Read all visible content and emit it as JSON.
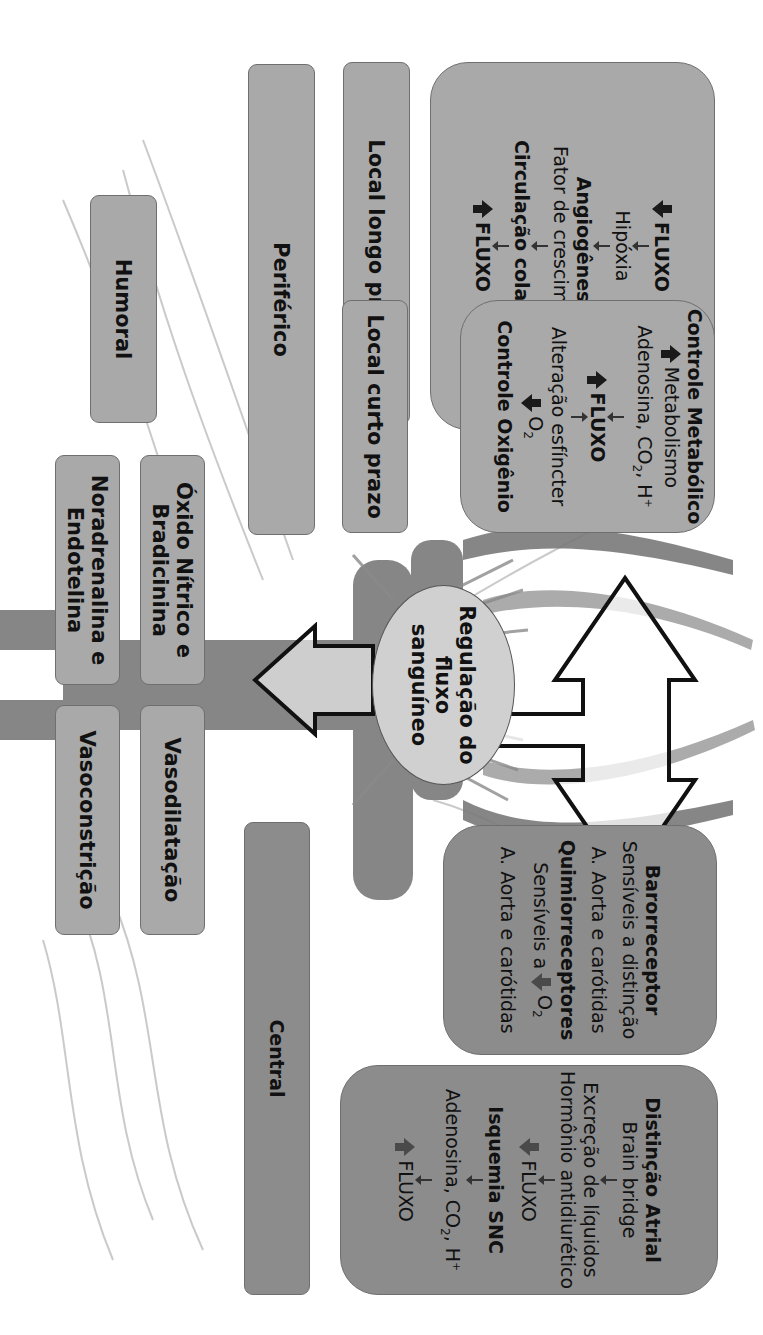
{
  "diagram": {
    "title": "Regulação do fluxo sanguíneo",
    "center_label": [
      "Regulação do",
      "fluxo",
      "sanguíneo"
    ],
    "categories": {
      "peripheral": "Periférico",
      "central": "Central",
      "humoral": "Humoral",
      "local_long": "Local longo prazo",
      "local_short": "Local curto prazo"
    },
    "boxes": {
      "angiogenesis": {
        "lines": [
          {
            "icon": "arrow-down-icon",
            "text": "FLUXO",
            "bold": true
          },
          {
            "text": "Hipóxia"
          },
          {
            "text": "Angiogênese",
            "bold": true
          },
          {
            "text": "Fator de crescimento"
          },
          {
            "text": "Circulação colateral",
            "bold": true
          },
          {
            "icon": "arrow-up-icon",
            "text": "FLUXO",
            "bold": true
          }
        ]
      },
      "metabolic": {
        "title": "Controle Metabólico",
        "l1": "Metabolismo",
        "l2_pre": "Adenosina, CO",
        "l2_sub": "2",
        "l2_post": ",  H",
        "l2_sup": "+",
        "l3": "FLUXO",
        "l4": "Alteração esfíncter",
        "l5_pre": "O",
        "l5_sub": "2",
        "l6": "Controle Oxigênio"
      },
      "humoral_left": "Óxido Nítrico e Bradicinina",
      "humoral_left2": "Noradrenalina e Endotelina",
      "effect_dilation": "Vasodilatação",
      "effect_constriction": "Vasoconstrição",
      "receptors": {
        "baro_title": "Barorreceptor",
        "baro_l1": "Sensíveis a distinção",
        "baro_l2": "A. Aorta e carótidas",
        "chemo_title": "Quimiorreceptores",
        "chemo_l1": "Sensíveis a",
        "chemo_o": "O",
        "chemo_sub": "2",
        "chemo_l2": "A. Aorta e carótidas"
      },
      "atrial": {
        "title": "Distinção Atrial",
        "l1": "Brain bridge",
        "l2": "Excreção de líquidos",
        "l3": "Hormônio antidiurético",
        "l4": "FLUXO",
        "title2": "Isquemia SNC",
        "l5_pre": "Adenosina, CO",
        "l5_sub": "2",
        "l5_post": ",  H",
        "l5_sup": "+",
        "l6": "FLUXO"
      }
    },
    "colors": {
      "peripheral_box": "#a9a9a9",
      "central_box": "#8c8c8c",
      "ellipse": "#d0d0d0",
      "vessel": "#7a7a7a",
      "arrow_dark": "#1a1a1a",
      "arrow_central": "#4a4a4a"
    }
  }
}
